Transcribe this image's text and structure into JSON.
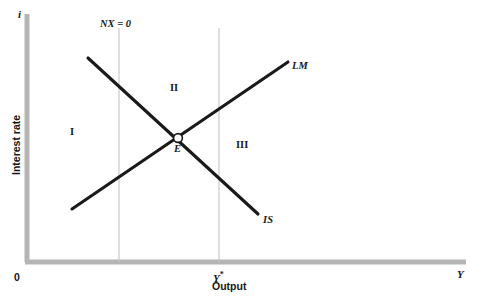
{
  "figure": {
    "axes": {
      "y_var": "i",
      "y_name": "Interest rate",
      "x_var": "Y",
      "x_name": "Output",
      "origin": "0"
    },
    "ticks": {
      "x": [
        {
          "label": "Y*",
          "value": 219
        }
      ]
    },
    "vertical_lines": [
      {
        "name": "NX = 0",
        "label": "NX = 0",
        "x": 119
      },
      {
        "name": "Y*",
        "label": "",
        "x": 219
      }
    ],
    "curves": [
      {
        "name": "LM",
        "label": "LM",
        "slope": "upward"
      },
      {
        "name": "IS",
        "label": "IS",
        "slope": "downward"
      }
    ],
    "equilibrium": {
      "label": "E"
    },
    "regions": [
      {
        "label": "I"
      },
      {
        "label": "II"
      },
      {
        "label": "III"
      }
    ],
    "colors": {
      "axis": "#b3b3b3",
      "gridline": "#c4c4c4",
      "curve": "#1a1a1a",
      "text": "#1a1a1a",
      "background": "#ffffff"
    }
  },
  "chart_data": {
    "type": "line",
    "title": "",
    "xlabel": "Output",
    "ylabel": "Interest rate",
    "x_axis_symbol": "Y",
    "y_axis_symbol": "i",
    "xlim": [
      0,
      482
    ],
    "ylim": [
      0,
      300
    ],
    "grid": false,
    "legend": "inline-curve-labels",
    "series": [
      {
        "name": "LM",
        "label": "LM",
        "type": "line",
        "points": [
          [
            72,
            209
          ],
          [
            288,
            62
          ]
        ]
      },
      {
        "name": "IS",
        "label": "IS",
        "type": "line",
        "points": [
          [
            88,
            58
          ],
          [
            258,
            214
          ]
        ]
      },
      {
        "name": "NX = 0",
        "label": "NX = 0",
        "type": "vline",
        "points": [
          [
            119,
            28
          ],
          [
            119,
            262
          ]
        ]
      },
      {
        "name": "Y* potential output",
        "label": "Y*",
        "type": "vline",
        "points": [
          [
            219,
            28
          ],
          [
            219,
            262
          ]
        ]
      }
    ],
    "annotations": [
      {
        "text": "E",
        "x": 178,
        "y": 148,
        "note": "equilibrium intersection of IS and LM"
      },
      {
        "text": "I",
        "x": 72,
        "y": 133,
        "note": "region I"
      },
      {
        "text": "II",
        "x": 172,
        "y": 89,
        "note": "region II"
      },
      {
        "text": "III",
        "x": 238,
        "y": 146,
        "note": "region III"
      },
      {
        "text": "NX = 0",
        "x": 102,
        "y": 26,
        "note": "external balance line label"
      },
      {
        "text": "LM",
        "x": 293,
        "y": 68,
        "note": "LM curve label"
      },
      {
        "text": "IS",
        "x": 264,
        "y": 222,
        "note": "IS curve label"
      },
      {
        "text": "0",
        "x": 16,
        "y": 280,
        "note": "origin"
      },
      {
        "text": "Y*",
        "x": 215,
        "y": 279,
        "note": "x tick label"
      },
      {
        "text": "Y",
        "x": 458,
        "y": 274,
        "note": "x axis variable"
      },
      {
        "text": "i",
        "x": 19,
        "y": 16,
        "note": "y axis variable"
      }
    ]
  }
}
